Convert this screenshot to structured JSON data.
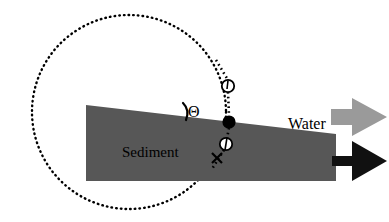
{
  "figure": {
    "background_color": "#ffffff",
    "width": 389,
    "height": 222
  },
  "labels": {
    "sediment": "Sediment",
    "water": "Water",
    "theta": "Θ"
  },
  "colors": {
    "sediment_fill": "#575757",
    "water_arrow_fill": "#9a9a9a",
    "sediment_arrow_fill": "#111111",
    "ink": "#000000",
    "background": "#ffffff"
  },
  "geometry": {
    "dotted_circle": {
      "center_x": 129,
      "center_y": 112,
      "radius": 97,
      "style": "dotted",
      "dot_color": "#000000"
    },
    "sediment_wedge": {
      "left_x": 86,
      "right_x": 336,
      "top_left_y": 105,
      "top_right_y": 134,
      "bottom_y": 181
    },
    "trajectory": {
      "style": "dotted",
      "from_x": 218,
      "from_y": 63,
      "to_x": 232,
      "to_y": 180
    },
    "markers": [
      {
        "name": "upper-open-circle",
        "x": 228,
        "y": 86,
        "r": 6,
        "type": "open-circle-with-tick"
      },
      {
        "name": "filled-dot",
        "x": 229,
        "y": 122,
        "r": 6,
        "type": "filled-circle"
      },
      {
        "name": "lower-open-circle",
        "x": 226,
        "y": 144,
        "r": 6,
        "type": "open-circle-with-tick"
      },
      {
        "name": "cross-mark",
        "x": 217,
        "y": 158,
        "r": 6,
        "type": "x-cross"
      }
    ],
    "water_arrow": {
      "tail_x": 331,
      "tip_x": 387,
      "center_y": 117,
      "shaft_half_height": 8,
      "head_half_height": 19
    },
    "sediment_arrow": {
      "tail_x": 336,
      "tip_x": 387,
      "center_y": 161,
      "shaft_half_height": 5,
      "head_half_height": 20
    },
    "theta_arc": {
      "cx": 196,
      "cy": 118,
      "label_anchor_x": 188,
      "label_anchor_y": 104
    }
  },
  "icon_names": {
    "water_flow": "right-arrow-icon",
    "sediment_flow": "right-arrow-icon",
    "angle_marker": "angle-arc-icon",
    "particle": "filled-circle-marker-icon",
    "void": "open-circle-marker-icon",
    "cross": "x-cross-marker-icon"
  }
}
